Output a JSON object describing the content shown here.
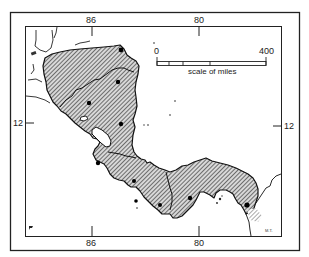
{
  "map": {
    "title": "",
    "region": "Central America (Guatemala to Panama)",
    "graticule": {
      "top_longitudes": [
        "86",
        "80"
      ],
      "bottom_longitudes": [
        "86",
        "80"
      ],
      "left_latitudes": [
        "12"
      ],
      "right_latitudes": [
        "12"
      ]
    },
    "scale_bar": {
      "start_label": "0",
      "end_label": "400",
      "caption": "scale of miles"
    },
    "credit": "M.T.",
    "colors": {
      "land_hatch": "#2a2a2a",
      "outline": "#111111",
      "frame": "#222222",
      "background": "#ffffff"
    },
    "features": [
      {
        "type": "shaded-region",
        "name": "Central American isthmus (hatched)"
      },
      {
        "type": "lake",
        "name": "Lake Nicaragua"
      },
      {
        "type": "site-dots",
        "count": 10
      },
      {
        "type": "islands",
        "name": "Caribbean offshore islands"
      }
    ]
  }
}
